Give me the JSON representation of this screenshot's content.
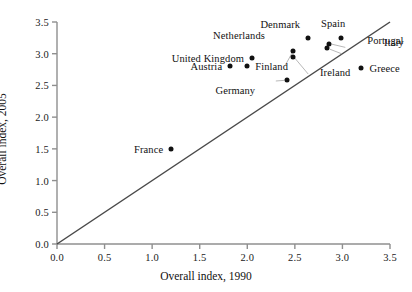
{
  "chart_data": {
    "type": "scatter",
    "title": "",
    "xlabel": "Overall index, 1990",
    "ylabel": "Overall index, 2005",
    "xlim": [
      0.0,
      3.5
    ],
    "ylim": [
      0.0,
      3.5
    ],
    "xticks": [
      "0.0",
      "0.5",
      "1.0",
      "1.5",
      "2.0",
      "2.5",
      "3.0",
      "3.5"
    ],
    "yticks": [
      "0.0",
      "0.5",
      "1.0",
      "1.5",
      "2.0",
      "2.5",
      "3.0",
      "3.5"
    ],
    "grid": false,
    "legend": "none",
    "reference_line": {
      "description": "45-degree identity line",
      "from": [
        0.0,
        0.0
      ],
      "to": [
        3.5,
        3.5
      ]
    },
    "points": [
      {
        "label": "France",
        "x": 1.2,
        "y": 1.5,
        "label_pos": "left"
      },
      {
        "label": "Austria",
        "x": 1.82,
        "y": 2.8,
        "label_pos": "left"
      },
      {
        "label": "United Kingdom",
        "x": 2.05,
        "y": 2.93,
        "label_pos": "left"
      },
      {
        "label": "Finland",
        "x": 2.0,
        "y": 2.8,
        "label_pos": "right"
      },
      {
        "label": "Germany",
        "x": 2.42,
        "y": 2.59,
        "label_pos": "left"
      },
      {
        "label": "Netherlands",
        "x": 2.48,
        "y": 3.04,
        "label_pos": "left"
      },
      {
        "label": "Ireland",
        "x": 2.48,
        "y": 2.95,
        "label_pos": "right"
      },
      {
        "label": "Denmark",
        "x": 2.64,
        "y": 3.24,
        "label_pos": "left"
      },
      {
        "label": "Portugal",
        "x": 2.84,
        "y": 3.09,
        "label_pos": "right"
      },
      {
        "label": "Italy",
        "x": 2.86,
        "y": 3.16,
        "label_pos": "right"
      },
      {
        "label": "Spain",
        "x": 2.99,
        "y": 3.25,
        "label_pos": "left"
      },
      {
        "label": "Greece",
        "x": 3.2,
        "y": 2.78,
        "label_pos": "right"
      }
    ],
    "leader_lines": [
      {
        "label": "Netherlands",
        "from": [
          2.4,
          2.82
        ],
        "to": [
          2.47,
          3.01
        ]
      },
      {
        "label": "Ireland",
        "from": [
          2.64,
          2.68
        ],
        "to": [
          2.5,
          2.93
        ]
      },
      {
        "label": "Germany",
        "from": [
          2.3,
          2.57
        ],
        "to": [
          2.39,
          2.58
        ]
      },
      {
        "label": "Italy",
        "from": [
          3.03,
          3.1
        ],
        "to": [
          2.89,
          3.15
        ]
      },
      {
        "label": "Portugal",
        "from": [
          2.99,
          3.0
        ],
        "to": [
          2.87,
          3.07
        ]
      }
    ],
    "colors": {
      "marker": "#111111",
      "axis": "#8f8f8f",
      "reference_line": "#4a4a4a",
      "text": "#1a1a1a",
      "background": "#ffffff"
    }
  },
  "labels": {
    "france": "France",
    "austria": "Austria",
    "united_kingdom": "United Kingdom",
    "finland": "Finland",
    "germany": "Germany",
    "netherlands": "Netherlands",
    "ireland": "Ireland",
    "denmark": "Denmark",
    "portugal": "Portugal",
    "italy": "Italy",
    "spain": "Spain",
    "greece": "Greece"
  }
}
